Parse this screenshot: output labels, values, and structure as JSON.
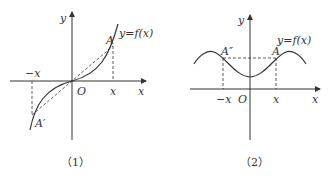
{
  "figures": [
    {
      "caption": "（1）",
      "labels": {
        "y_axis": "y",
        "x_axis": "x",
        "origin": "O",
        "function": "y=f(x)",
        "point_a": "A",
        "point_a_prime": "A′",
        "pos_x": "x",
        "neg_x": "−x"
      },
      "description": "Odd function: graph symmetric about origin; A and A′ joined by dashed segment through O"
    },
    {
      "caption": "（2）",
      "labels": {
        "y_axis": "y",
        "x_axis": "x",
        "origin": "O",
        "function": "y=f(x)",
        "point_a": "A",
        "point_a_double_prime": "A″",
        "pos_x": "x",
        "neg_x": "−x"
      },
      "description": "Even function: graph symmetric about y-axis; A and A″ joined by horizontal dashed segment"
    }
  ],
  "colors": {
    "ink": "#333333",
    "background": "#ffffff"
  }
}
